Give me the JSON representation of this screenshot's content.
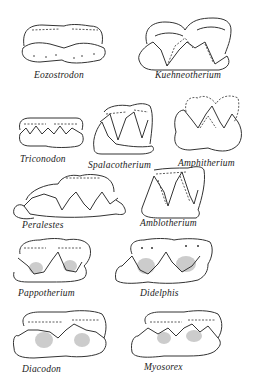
{
  "figure": {
    "caption_fragment": "",
    "specimens": [
      {
        "id": "eozostrodon",
        "label": "Eozostrodon"
      },
      {
        "id": "kuehneotherium",
        "label": "Kuehneotherium"
      },
      {
        "id": "triconodon",
        "label": "Triconodon"
      },
      {
        "id": "spalacotherium",
        "label": "Spalacotherium"
      },
      {
        "id": "amphitherium",
        "label": "Amphitherium"
      },
      {
        "id": "peralestes",
        "label": "Peralestes"
      },
      {
        "id": "amblotherium",
        "label": "Amblotherium"
      },
      {
        "id": "pappotherium",
        "label": "Pappotherium"
      },
      {
        "id": "didelphis",
        "label": "Didelphis"
      },
      {
        "id": "diacodon",
        "label": "Diacodon"
      },
      {
        "id": "myosorex",
        "label": "Myosorex"
      }
    ]
  }
}
